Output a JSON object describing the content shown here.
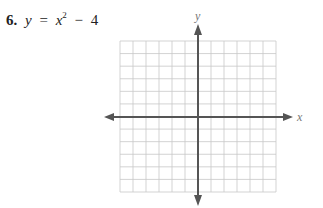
{
  "problem": {
    "number": "6.",
    "lhs": "y",
    "eq": "=",
    "base": "x",
    "exponent": "2",
    "op": "−",
    "constant": "4"
  },
  "graph": {
    "x_axis_label": "x",
    "y_axis_label": "y",
    "grid_cols": 12,
    "grid_rows": 12,
    "grid_color": "#c8c8c8",
    "axis_color": "#555555"
  },
  "chart_data": {
    "type": "line",
    "xlabel": "x",
    "ylabel": "y",
    "grid": true,
    "grid_cells": [
      12,
      12
    ],
    "series": []
  }
}
